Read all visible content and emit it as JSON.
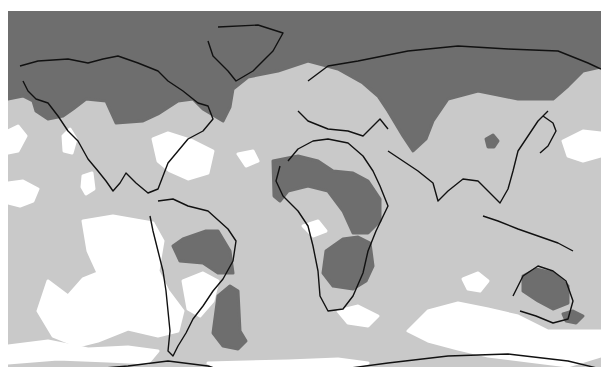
{
  "map": {
    "type": "global-shaded-anomaly-map",
    "projection": "equirectangular",
    "legend": null,
    "title": null,
    "frame": {
      "x": 8,
      "y": 11,
      "width": 593,
      "height": 356
    },
    "levels": [
      {
        "name": "high",
        "color": "#6e6e6e"
      },
      {
        "name": "medium",
        "color": "#c9c9c9"
      },
      {
        "name": "low",
        "color": "#ffffff"
      }
    ],
    "coastline_color": "#111111",
    "regions": {
      "dark": [
        {
          "name": "arctic-north",
          "points": "0,0 593,0 593,56 575,60 560,75 545,88 510,88 490,84 470,80 440,88 425,110 418,128 405,140 395,125 380,100 370,85 355,72 330,58 300,50 270,60 240,66 225,78 222,96 215,110 195,98 185,88 170,90 150,103 135,110 108,112 98,90 78,88 65,98 55,105 40,108 28,100 25,90 15,85 0,88"
        },
        {
          "name": "sahel",
          "points": "265,150 290,145 310,150 325,160 345,162 360,170 372,188 372,210 360,222 345,222 335,200 320,180 300,175 280,180 272,190 266,185"
        },
        {
          "name": "southern-africa",
          "points": "318,240 335,228 350,226 362,232 365,255 358,270 345,278 325,275 315,262"
        },
        {
          "name": "amazon",
          "points": "165,235 175,228 198,220 210,220 222,240 225,262 210,262 195,252 172,250"
        },
        {
          "name": "patagonia-atlantic",
          "points": "210,285 222,275 230,280 232,320 238,330 230,338 215,335 205,322"
        },
        {
          "name": "australia",
          "points": "515,265 528,258 545,262 560,275 560,292 545,298 530,290 515,280"
        },
        {
          "name": "tasmania-sea",
          "points": "555,303 565,300 575,305 568,312 558,310"
        },
        {
          "name": "china-spot",
          "points": "478,128 485,124 490,130 486,136 480,136"
        },
        {
          "name": "antarctic-peninsula",
          "points": "140,363 200,363 212,368 218,380 210,395 190,402 165,402 142,395"
        }
      ],
      "white": [
        {
          "name": "north-atlantic-patch",
          "points": "145,128 160,122 185,130 205,140 200,162 180,168 162,160 150,150"
        },
        {
          "name": "pacific-ne-spot",
          "points": "55,125 62,118 68,128 64,142 56,140"
        },
        {
          "name": "pacific-spot-2",
          "points": "75,165 84,162 86,178 78,183 74,176"
        },
        {
          "name": "africa-west-spot",
          "points": "230,143 245,140 250,150 238,155"
        },
        {
          "name": "pacific-west-edge",
          "points": "0,120 10,115 18,125 10,140 0,142"
        },
        {
          "name": "pacific-west-2",
          "points": "0,172 15,170 30,178 25,190 12,195 0,192"
        },
        {
          "name": "south-pacific-belt",
          "points": "75,210 105,205 145,212 155,230 150,260 160,280 175,300 170,320 150,325 120,318 90,330 70,335 45,325 30,300 40,270 60,285 75,268 90,262 80,240"
        },
        {
          "name": "andes-interior",
          "points": "175,270 195,262 210,270 205,290 192,305 180,298"
        },
        {
          "name": "south-atlantic-island-spots",
          "points": "295,215 310,210 318,220 305,225"
        },
        {
          "name": "south-indian-belt",
          "points": "420,300 450,292 480,298 510,305 540,320 593,320 593,345 560,355 520,350 480,345 450,338 420,330 400,320"
        },
        {
          "name": "east-pacific-cap",
          "points": "555,130 575,120 593,122 593,145 575,150 560,145"
        },
        {
          "name": "antarctic-coast-band",
          "points": "200,352 280,350 330,348 360,352 330,362 300,368 260,368 230,365"
        },
        {
          "name": "southern-ocean-white",
          "points": "0,335 40,330 80,338 120,336 150,340 140,352 100,350 50,348 0,352"
        },
        {
          "name": "australia-west-white",
          "points": "455,268 470,262 480,270 472,280 460,278"
        },
        {
          "name": "indian-ocean-white",
          "points": "330,300 350,295 370,305 360,315 340,312"
        }
      ]
    },
    "coastlines": {
      "north-america": "12,55 30,50 60,48 80,52 95,48 110,45 130,52 150,60 160,70 175,80 190,92 200,95 205,108 195,120 180,128 170,140 160,152 155,165 150,178 140,182 128,172 118,162 112,172 105,180 98,170 90,160 80,148 70,130 60,120 50,105 40,92 28,88 20,80 15,70",
      "greenland": "210,16 250,14 275,22 265,40 245,60 228,70 220,60 205,45 200,30",
      "south-america": "150,190 165,188 180,195 200,200 220,218 228,230 225,250 215,268 205,280 195,295 185,308 178,322 170,335 165,345 160,340 162,320 160,300 158,280 155,260 150,240 145,220 142,205",
      "africa-europe": "280,150 290,138 305,130 320,128 340,132 355,145 365,160 372,175 380,195 368,220 360,240 355,262 345,285 335,298 320,300 312,285 310,260 305,235 300,215 290,200 275,185 268,170 272,155",
      "eurasia-north": "300,70 320,55 350,50 400,40 450,35 500,38 550,40 580,52 593,58",
      "europe-med": "290,100 300,110 320,118 340,120 355,125 365,115 372,108 380,118",
      "asia-south": "380,140 395,150 410,160 425,172 430,190 440,180 455,168 470,170 480,180 492,192 500,178 505,160 510,140 520,125 530,110 540,100",
      "japan-islands": "535,105 545,112 548,120 540,135 532,142",
      "indonesia": "475,205 490,210 510,218 530,225 550,232 565,240",
      "australia": "505,285 515,265 530,255 545,260 558,270 565,290 560,308 545,312 528,305 512,300",
      "antarctica": "20,372 60,360 120,355 160,350 200,355 230,365 270,368 320,360 380,352 440,345 500,343 560,350 593,358"
    }
  }
}
